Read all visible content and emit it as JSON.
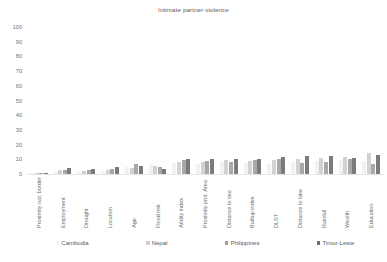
{
  "chart_data": {
    "type": "bar",
    "title": "Intimate partner violence",
    "xlabel": "",
    "ylabel": "",
    "ylim": [
      0,
      100
    ],
    "yticks": [
      100,
      90,
      80,
      70,
      60,
      50,
      40,
      30,
      20,
      10,
      0
    ],
    "grid": false,
    "legend_position": "bottom",
    "categories": [
      "Proximity nat. border",
      "Employment",
      "Drought",
      "Location",
      "Age",
      "Flood risk",
      "Aridity index",
      "Proximity prot. Area",
      "Distance to sea",
      "Builtup index",
      "DLST",
      "Distance to lake",
      "Rainfall",
      "Wealth",
      "Education"
    ],
    "series": [
      {
        "name": "Cambodia",
        "color": "#f2f2f2",
        "values": [
          0.6,
          1.5,
          1.2,
          2.0,
          5.0,
          6.5,
          7.5,
          7.0,
          8.0,
          7.5,
          7.0,
          8.5,
          9.0,
          9.5,
          9.0
        ]
      },
      {
        "name": "Nepal",
        "color": "#d2d2d2",
        "values": [
          0.8,
          2.5,
          2.0,
          3.0,
          4.0,
          5.5,
          8.5,
          8.0,
          9.5,
          9.0,
          9.5,
          10.5,
          11.0,
          11.5,
          14.0
        ]
      },
      {
        "name": "Philippines",
        "color": "#a8a8a8",
        "values": [
          0.5,
          3.0,
          2.5,
          3.5,
          6.5,
          4.5,
          9.5,
          9.0,
          8.5,
          9.5,
          10.0,
          7.5,
          8.5,
          10.0,
          7.0
        ]
      },
      {
        "name": "Timor-Leste",
        "color": "#7b7b7b",
        "values": [
          0.7,
          4.0,
          3.5,
          5.0,
          5.5,
          3.5,
          10.0,
          10.5,
          10.0,
          10.5,
          11.5,
          12.5,
          12.0,
          11.0,
          13.0
        ]
      }
    ]
  }
}
